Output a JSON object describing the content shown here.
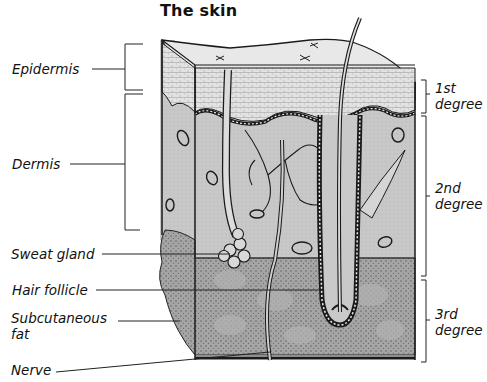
{
  "title": "The skin",
  "labels": {
    "left": [
      {
        "id": "epidermis",
        "text": "Epidermis"
      },
      {
        "id": "dermis",
        "text": "Dermis"
      },
      {
        "id": "sweat_gland",
        "text": "Sweat gland"
      },
      {
        "id": "hair_follicle",
        "text": "Hair follicle"
      },
      {
        "id": "subcutaneous_fat_1",
        "text": "Subcutaneous"
      },
      {
        "id": "subcutaneous_fat_2",
        "text": "fat"
      },
      {
        "id": "nerve",
        "text": "Nerve"
      }
    ],
    "right": [
      {
        "id": "first_degree_num",
        "text": "1st"
      },
      {
        "id": "first_degree_word",
        "text": "degree"
      },
      {
        "id": "second_degree_num",
        "text": "2nd"
      },
      {
        "id": "second_degree_word",
        "text": "degree"
      },
      {
        "id": "third_degree_num",
        "text": "3rd"
      },
      {
        "id": "third_degree_word",
        "text": "degree"
      }
    ]
  },
  "colors": {
    "epidermis": "#e4e4e4",
    "dermis": "#c9c9c9",
    "subcutaneous": "#a3a3a3",
    "line": "#1a1a1a"
  }
}
